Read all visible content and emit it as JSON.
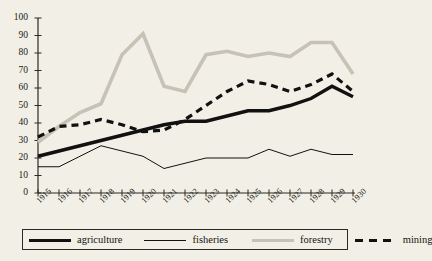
{
  "chart_data": {
    "type": "line",
    "title": "",
    "subtitle": "",
    "xlabel": "",
    "ylabel": "",
    "xlim": [
      1915,
      1930
    ],
    "ylim": [
      0,
      100
    ],
    "ytick_step": 10,
    "grid": false,
    "legend_position": "bottom",
    "categories": [
      "1915",
      "1916",
      "1917",
      "1918",
      "1919",
      "1920",
      "1921",
      "1922",
      "1923",
      "1924",
      "1925",
      "1926",
      "1927",
      "1928",
      "1929",
      "1930"
    ],
    "yticks": [
      "0",
      "10",
      "20",
      "30",
      "40",
      "50",
      "60",
      "70",
      "80",
      "90",
      "100"
    ],
    "series": [
      {
        "name": "agriculture",
        "style": "solid-thick",
        "color": "#111111",
        "values": [
          21,
          24,
          27,
          30,
          33,
          36,
          39,
          41,
          41,
          44,
          47,
          47,
          50,
          54,
          61,
          55
        ]
      },
      {
        "name": "fisheries",
        "style": "solid-thin",
        "color": "#111111",
        "values": [
          15,
          15,
          21,
          27,
          24,
          21,
          14,
          17,
          20,
          20,
          20,
          25,
          21,
          25,
          22,
          22
        ]
      },
      {
        "name": "forestry",
        "style": "solid-thick-gray",
        "color": "#c6c3b6",
        "values": [
          29,
          38,
          46,
          51,
          79,
          91,
          61,
          58,
          79,
          81,
          78,
          80,
          78,
          86,
          86,
          68
        ]
      },
      {
        "name": "mining",
        "style": "dashed",
        "color": "#111111",
        "values": [
          32,
          38,
          39,
          42,
          39,
          35,
          36,
          42,
          50,
          58,
          64,
          62,
          58,
          62,
          68,
          58
        ]
      }
    ]
  },
  "axis": {
    "y_labels": [
      "100",
      "90",
      "80",
      "70",
      "60",
      "50",
      "40",
      "30",
      "20",
      "10",
      "0"
    ],
    "x_labels": [
      "1915",
      "1916",
      "1917",
      "1918",
      "1919",
      "1920",
      "1921",
      "1922",
      "1923",
      "1924",
      "1925",
      "1926",
      "1927",
      "1928",
      "1929",
      "1930"
    ]
  },
  "legend": {
    "items": [
      {
        "label": "agriculture",
        "swatch": "thick-black-line"
      },
      {
        "label": "fisheries",
        "swatch": "thin-black-line"
      },
      {
        "label": "forestry",
        "swatch": "thick-gray-line"
      },
      {
        "label": "mining",
        "swatch": "dashed-black-line"
      }
    ]
  },
  "source": {
    "text": ""
  }
}
